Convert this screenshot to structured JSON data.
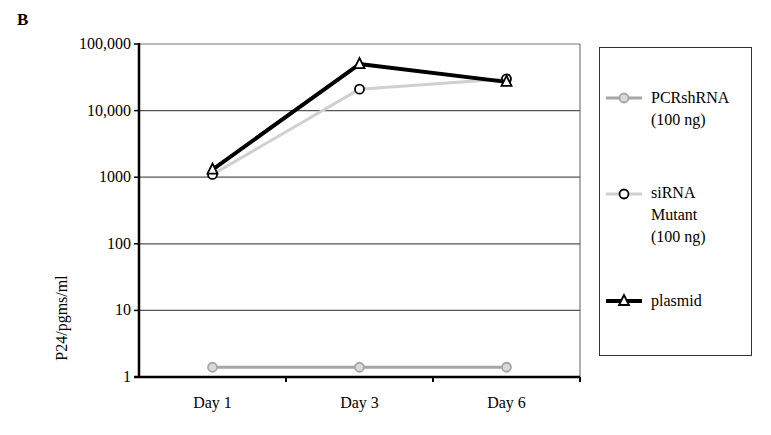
{
  "panel_label": "B",
  "chart_data": {
    "type": "line",
    "title": "",
    "xlabel": "",
    "ylabel": "P24/pgms/ml",
    "yscale": "log",
    "ylim": [
      1,
      100000
    ],
    "categories": [
      "Day 1",
      "Day 3",
      "Day 6"
    ],
    "yticks": [
      "100,000",
      "10,000",
      "1000",
      "100",
      "10",
      "1"
    ],
    "ytick_values": [
      100000,
      10000,
      1000,
      100,
      10,
      1
    ],
    "grid": true,
    "legend_position": "right",
    "series": [
      {
        "name": "PCRshRNA (100 ng)",
        "label_lines": "PCRshRNA\n(100 ng)",
        "values": [
          1.4,
          1.4,
          1.4
        ],
        "color": "#a6a6a6",
        "marker": "circle",
        "marker_fill": "#d9d9d9"
      },
      {
        "name": "siRNA Mutant (100 ng)",
        "label_lines": "siRNA\nMutant\n(100 ng)",
        "values": [
          1100,
          21000,
          30000
        ],
        "color": "#d0d0d0",
        "marker": "circle",
        "marker_fill": "#ffffff"
      },
      {
        "name": "plasmid",
        "label_lines": "plasmid",
        "values": [
          1300,
          50000,
          27000
        ],
        "color": "#000000",
        "marker": "triangle",
        "marker_fill": "#ffffff"
      }
    ]
  }
}
